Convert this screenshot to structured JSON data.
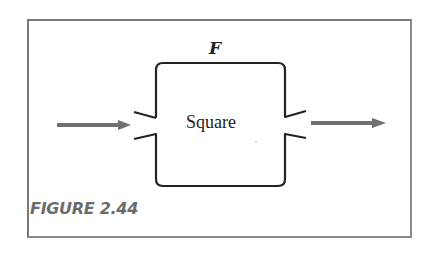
{
  "figure": {
    "caption": "FIGURE 2.44",
    "function_label": "F",
    "box_label": "Square",
    "colors": {
      "frame": "#7a7a7a",
      "box_stroke": "#222222",
      "arrow": "#707070",
      "caption": "#6b6b6b"
    }
  },
  "diagram": {
    "nodes": [
      {
        "id": "square",
        "label": "Square",
        "title": "F",
        "shape": "rounded-rect"
      }
    ],
    "edges": [
      {
        "id": "input",
        "to": "square",
        "direction": "in",
        "side": "left"
      },
      {
        "id": "output",
        "from": "square",
        "direction": "out",
        "side": "right"
      }
    ]
  }
}
